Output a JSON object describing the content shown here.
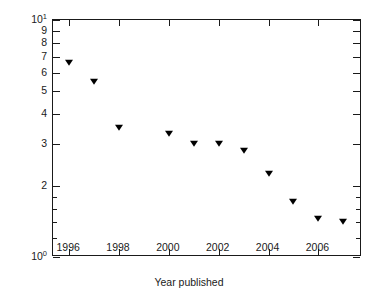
{
  "chart_data": {
    "type": "scatter",
    "title": "",
    "xlabel": "Year published",
    "ylabel": "Pixel size (μm)",
    "x": [
      1996,
      1997,
      1998,
      2000,
      2001,
      2002,
      2003,
      2004,
      2005,
      2006,
      2007
    ],
    "values": [
      6.6,
      5.5,
      3.5,
      3.3,
      3.0,
      3.0,
      2.8,
      2.25,
      1.7,
      1.45,
      1.4
    ],
    "series": [
      {
        "name": "Pixel size",
        "marker": "filled-down-triangle",
        "color": "#000000",
        "points": [
          {
            "x": 1996,
            "y": 6.6
          },
          {
            "x": 1997,
            "y": 5.5
          },
          {
            "x": 1998,
            "y": 3.5
          },
          {
            "x": 2000,
            "y": 3.3
          },
          {
            "x": 2001,
            "y": 3.0
          },
          {
            "x": 2002,
            "y": 3.0
          },
          {
            "x": 2003,
            "y": 2.8
          },
          {
            "x": 2004,
            "y": 2.25
          },
          {
            "x": 2005,
            "y": 1.7
          },
          {
            "x": 2006,
            "y": 1.45
          },
          {
            "x": 2007,
            "y": 1.4
          }
        ]
      }
    ],
    "xscale": "linear",
    "yscale": "log",
    "xlim": [
      1995.35,
      2007.75
    ],
    "ylim": [
      1,
      10
    ],
    "grid": false,
    "legend": false,
    "xticks": [
      1996,
      1998,
      2000,
      2002,
      2004,
      2006
    ],
    "xticklabels": [
      "1996",
      "1998",
      "2000",
      "2002",
      "2004",
      "2006"
    ],
    "yticks": [
      1,
      2,
      3,
      4,
      5,
      6,
      7,
      8,
      9,
      10
    ],
    "yticklabels": [
      "10",
      "2",
      "3",
      "4",
      "5",
      "6",
      "7",
      "8",
      "9",
      "10"
    ],
    "ytick_exponents": {
      "1": "0",
      "10": "1"
    },
    "frame_color": "#1a1a1a",
    "background": "#ffffff"
  },
  "axes": {
    "y": {
      "title": "Pixel size (μm)",
      "labels": [
        {
          "text": "10",
          "sup": "1",
          "value": 10
        },
        {
          "text": "9",
          "sup": "",
          "value": 9
        },
        {
          "text": "8",
          "sup": "",
          "value": 8
        },
        {
          "text": "7",
          "sup": "",
          "value": 7
        },
        {
          "text": "6",
          "sup": "",
          "value": 6
        },
        {
          "text": "5",
          "sup": "",
          "value": 5
        },
        {
          "text": "4",
          "sup": "",
          "value": 4
        },
        {
          "text": "3",
          "sup": "",
          "value": 3
        },
        {
          "text": "2",
          "sup": "",
          "value": 2
        },
        {
          "text": "10",
          "sup": "0",
          "value": 1
        }
      ]
    },
    "x": {
      "title": "Year published",
      "labels": [
        "1996",
        "1998",
        "2000",
        "2002",
        "2004",
        "2006"
      ]
    }
  }
}
